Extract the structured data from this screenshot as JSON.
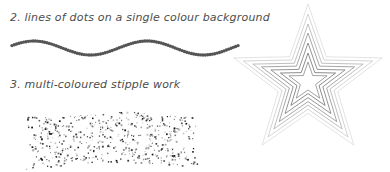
{
  "page": {
    "background_color": "#ffffff",
    "width": 390,
    "height": 172
  },
  "captions": {
    "dots_line": "2. lines of dots on a single colour background",
    "stipple": "3. multi-coloured stipple work",
    "text_color": "#4d4d4d"
  },
  "illustrations": {
    "dotted_wave": {
      "name": "dotted-wave-line",
      "description": "single row of evenly spaced round dots following a sine wave",
      "dot_color": "#555555",
      "dot_count": 98,
      "dot_radius": 1.7,
      "x_start": 12,
      "x_end": 238,
      "baseline_y": 20,
      "amplitude": 7,
      "periods": 2,
      "phase": 0.35
    },
    "stipple_cloud": {
      "name": "multi-coloured-stipple-cloud",
      "description": "dense irregular rectangular blob of tiny dark stipple dots",
      "dot_count": 560,
      "dot_colors": [
        "#1a1a1a",
        "#3c3c3c",
        "#5a5a5a",
        "#7d7d7d",
        "#a0a0a0",
        "#c2c2c2"
      ],
      "dot_size_min": 0.7,
      "dot_size_max": 1.9,
      "blob_x": 12,
      "blob_y": 9,
      "blob_width": 176,
      "blob_height": 54
    },
    "star_rings": {
      "name": "concentric-star-outlines",
      "description": "six nested five-pointed star outlines, lightest outside darkest inside",
      "center_x": 83,
      "center_y": 80,
      "points": 5,
      "rotation_deg": -90,
      "inner_ratio": 0.4,
      "rings": [
        {
          "outer_radius": 78,
          "stroke": "#dcdcdc",
          "width": 0.8
        },
        {
          "outer_radius": 68,
          "stroke": "#c9c9c9",
          "width": 0.8
        },
        {
          "outer_radius": 58,
          "stroke": "#aeaeae",
          "width": 0.8
        },
        {
          "outer_radius": 49,
          "stroke": "#8f8f8f",
          "width": 0.8
        },
        {
          "outer_radius": 39,
          "stroke": "#7a7a7a",
          "width": 0.8
        },
        {
          "outer_radius": 29,
          "stroke": "#6e6e6e",
          "width": 0.8
        },
        {
          "outer_radius": 20,
          "stroke": "#8a8a8a",
          "width": 0.8
        }
      ]
    }
  }
}
